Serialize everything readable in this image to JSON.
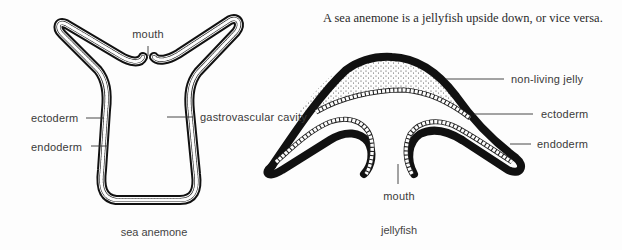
{
  "title": "A sea anemone is a jellyfish upside down, or vice versa.",
  "anemone": {
    "caption": "sea anemone",
    "labels": {
      "mouth": "mouth",
      "ectoderm": "ectoderm",
      "endoderm": "endoderm",
      "cavity": "gastrovascular cavity"
    }
  },
  "jellyfish": {
    "caption": "jellyfish",
    "labels": {
      "jelly": "non-living jelly",
      "ectoderm": "ectoderm",
      "endoderm": "endoderm",
      "mouth": "mouth"
    }
  },
  "colors": {
    "ink": "#111111",
    "background": "#fdfdfd",
    "label": "#3a3a3a"
  }
}
